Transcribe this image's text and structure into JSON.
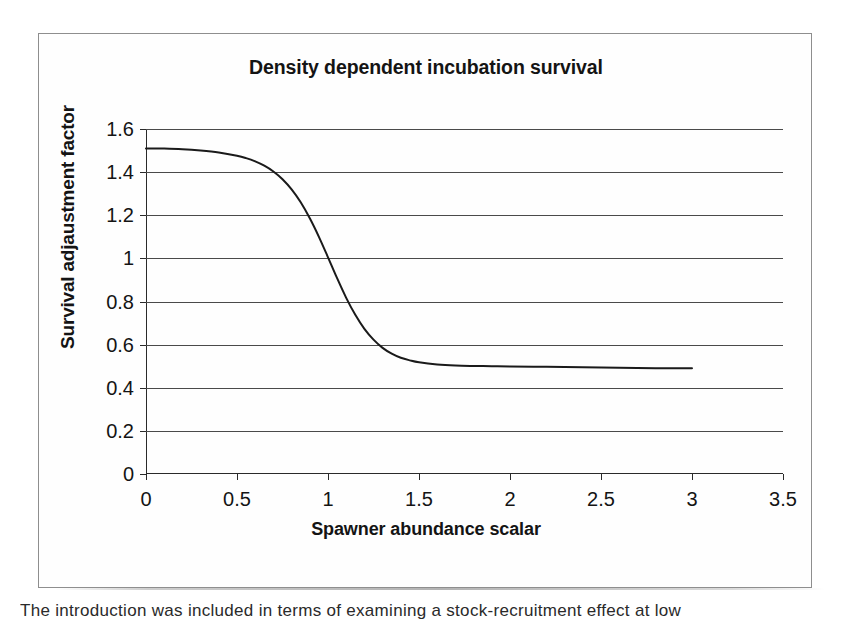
{
  "chart_data": {
    "type": "line",
    "title": "Density dependent incubation survival",
    "xlabel": "Spawner abundance scalar",
    "ylabel": "Survival adjaustment factor",
    "xlim": [
      0,
      3.5
    ],
    "ylim": [
      0,
      1.6
    ],
    "xticks": [
      "0",
      "0.5",
      "1",
      "1.5",
      "2",
      "2.5",
      "3",
      "3.5"
    ],
    "xtick_values": [
      0,
      0.5,
      1,
      1.5,
      2,
      2.5,
      3,
      3.5
    ],
    "yticks": [
      "0",
      "0.2",
      "0.4",
      "0.6",
      "0.8",
      "1",
      "1.2",
      "1.4",
      "1.6"
    ],
    "ytick_values": [
      0,
      0.2,
      0.4,
      0.6,
      0.8,
      1.0,
      1.2,
      1.4,
      1.6
    ],
    "grid": "horizontal",
    "legend": "none",
    "series": [
      {
        "name": "Survival adjustment factor",
        "color": "#1a1a1a",
        "x": [
          0.0,
          0.1,
          0.2,
          0.3,
          0.4,
          0.5,
          0.55,
          0.6,
          0.65,
          0.7,
          0.75,
          0.8,
          0.85,
          0.9,
          0.95,
          1.0,
          1.05,
          1.1,
          1.15,
          1.2,
          1.25,
          1.3,
          1.35,
          1.4,
          1.45,
          1.5,
          1.6,
          1.7,
          1.8,
          1.9,
          2.0,
          2.2,
          2.4,
          2.6,
          2.8,
          3.0
        ],
        "y": [
          1.51,
          1.509,
          1.506,
          1.5,
          1.491,
          1.476,
          1.465,
          1.45,
          1.43,
          1.403,
          1.367,
          1.32,
          1.26,
          1.186,
          1.1,
          1.005,
          0.908,
          0.817,
          0.738,
          0.673,
          0.623,
          0.585,
          0.558,
          0.539,
          0.527,
          0.518,
          0.508,
          0.503,
          0.501,
          0.5,
          0.499,
          0.497,
          0.495,
          0.493,
          0.491,
          0.49
        ]
      }
    ],
    "annotations": {
      "curve_start_value": 1.51,
      "curve_end_value": 0.49,
      "asymptote": 0.49,
      "inflection_x": 1.0,
      "curve_x_range": [
        0,
        3
      ]
    }
  },
  "page": {
    "caption_remnant": "The introduction was included in terms of examining a stock-recruitment effect at low"
  }
}
